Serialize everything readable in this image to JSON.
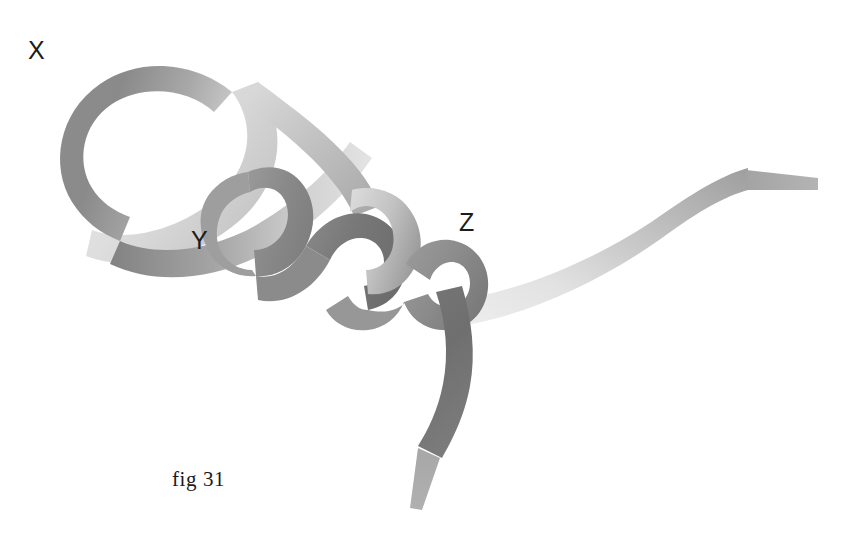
{
  "figure": {
    "caption": "fig 31",
    "background_color": "#ffffff",
    "width": 859,
    "height": 541,
    "labels": [
      {
        "id": "x",
        "text": "X",
        "x": 28,
        "y": 38,
        "color": "#1c1c1c"
      },
      {
        "id": "y",
        "text": "Y",
        "x": 191,
        "y": 228,
        "color": "#1c1c1c"
      },
      {
        "id": "z",
        "text": "Z",
        "x": 459,
        "y": 210,
        "color": "#1c1c1c"
      }
    ],
    "palette": {
      "ribbon_dark": "#6f6f6f",
      "ribbon_mid": "#8f8f8f",
      "ribbon_light": "#d9d9d9",
      "ribbon_lightest": "#efefef",
      "ribbon_darkest": "#5e5e5e",
      "label_text": "#1c1c1c",
      "caption_text": "#1a1a1a",
      "background": "#ffffff"
    },
    "ribbon": {
      "band_width_px": 28,
      "edge_on_width_px": 12,
      "segments": [
        {
          "name": "loop-x-outer",
          "shade": "dark",
          "note": "large open loop at upper left, label X"
        },
        {
          "name": "loop-x-inner-light",
          "shade": "light",
          "note": "inner/underside of the X loop, pale"
        },
        {
          "name": "twist-1",
          "shade": "mid",
          "note": "first crossing below Y"
        },
        {
          "name": "twist-2",
          "shade": "dark",
          "note": "second crossing, center"
        },
        {
          "name": "twist-3",
          "shade": "light",
          "note": "third crossing before Z"
        },
        {
          "name": "twist-4",
          "shade": "mid",
          "note": "final crossing at Z junction"
        },
        {
          "name": "tail-right",
          "shade": "light",
          "note": "band sweeping up to the right, ends edge-on"
        },
        {
          "name": "tail-bottom",
          "shade": "darkest",
          "note": "band curving down, ends edge-on"
        }
      ]
    }
  }
}
